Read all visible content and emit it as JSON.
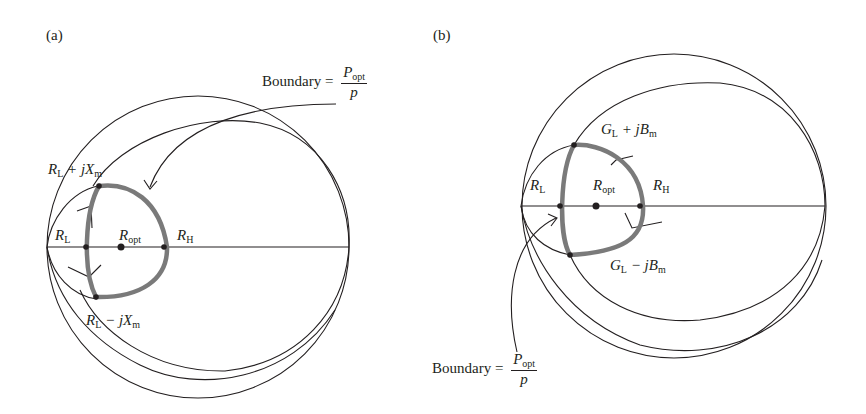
{
  "panels": [
    {
      "id": "a",
      "tag": "(a)",
      "labels": {
        "top_point_main": "R",
        "top_point_sub": "L",
        "top_point_rest": " + jX",
        "top_point_rest_sub": "m",
        "bottom_point_main": "R",
        "bottom_point_sub": "L",
        "bottom_point_rest": " − jX",
        "bottom_point_rest_sub": "m",
        "rl_main": "R",
        "rl_sub": "L",
        "ropt_main": "R",
        "ropt_sub": "opt",
        "rh_main": "R",
        "rh_sub": "H"
      },
      "boundary": {
        "word": "Boundary =",
        "num_main": "P",
        "num_sub": "opt",
        "den": "p"
      }
    },
    {
      "id": "b",
      "tag": "(b)",
      "labels": {
        "top_point_main": "G",
        "top_point_sub": "L",
        "top_point_rest": " + jB",
        "top_point_rest_sub": "m",
        "bottom_point_main": "G",
        "bottom_point_sub": "L",
        "bottom_point_rest": " − jB",
        "bottom_point_rest_sub": "m",
        "rl_main": "R",
        "rl_sub": "L",
        "ropt_main": "R",
        "ropt_sub": "opt",
        "rh_main": "R",
        "rh_sub": "H"
      },
      "boundary": {
        "word": "Boundary =",
        "num_main": "P",
        "num_sub": "opt",
        "den": "p"
      }
    }
  ],
  "colors": {
    "line": "#231f20",
    "boundary": "#7a7a7a",
    "background": "#ffffff"
  }
}
